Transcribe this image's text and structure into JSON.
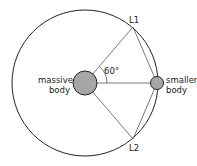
{
  "diagram": {
    "labels": {
      "l1": "L1",
      "l2": "L2",
      "angle": "60°",
      "massive_line1": "massive",
      "massive_line2": "body",
      "smaller_line1": "smaller",
      "smaller_line2": "body"
    },
    "colors": {
      "stroke": "#222222",
      "body_fill": "#a6a6a6",
      "background": "#ffffff"
    }
  }
}
